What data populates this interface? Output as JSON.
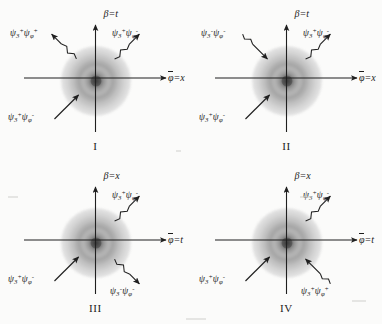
{
  "figure": {
    "type": "physics-feynman-diagram-grid",
    "rows": 2,
    "cols": 2,
    "background_color": "#fbfbfa",
    "ink_color": "#1f1f1f",
    "blob_center_color": "#3a3a3a",
    "blob_halo_color": "#d6d6d6"
  },
  "panels": [
    {
      "id": "I",
      "numeral": "I",
      "axis_vertical": {
        "greek": "β",
        "equals": "=",
        "var": "t"
      },
      "axis_horizontal": {
        "greek": "φ",
        "overbar": true,
        "equals": "=",
        "var": "x"
      },
      "particles": [
        {
          "slot": "top-left",
          "direction": "outgoing",
          "arrow_style": "wavy",
          "psi1": {
            "sym": "ψ",
            "sub": "3",
            "sup": "+"
          },
          "psi2": {
            "sym": "ψ",
            "sub": "φ",
            "sup": "+"
          }
        },
        {
          "slot": "top-right",
          "direction": "outgoing",
          "arrow_style": "wavy",
          "psi1": {
            "sym": "ψ",
            "sub": "3",
            "sup": "+"
          },
          "psi2": {
            "sym": "ψ",
            "sub": "φ",
            "sup": "-"
          }
        },
        {
          "slot": "bottom-left",
          "direction": "incoming",
          "arrow_style": "straight",
          "psi1": {
            "sym": "ψ",
            "sub": "3",
            "sup": "+"
          },
          "psi2": {
            "sym": "ψ",
            "sub": "φ",
            "sup": "-"
          }
        }
      ]
    },
    {
      "id": "II",
      "numeral": "II",
      "axis_vertical": {
        "greek": "β",
        "equals": "=",
        "var": "t"
      },
      "axis_horizontal": {
        "greek": "φ",
        "overbar": true,
        "equals": "=",
        "var": "x"
      },
      "particles": [
        {
          "slot": "top-left",
          "direction": "incoming",
          "arrow_style": "wavy",
          "psi1": {
            "sym": "ψ",
            "sub": "3",
            "sup": "-"
          },
          "psi2": {
            "sym": "ψ",
            "sub": "φ",
            "sup": "-"
          }
        },
        {
          "slot": "top-right",
          "direction": "outgoing",
          "arrow_style": "wavy",
          "psi1": {
            "sym": "ψ",
            "sub": "3",
            "sup": "+"
          },
          "psi2": {
            "sym": "ψ",
            "sub": "φ",
            "sup": "-"
          }
        },
        {
          "slot": "bottom-left",
          "direction": "incoming",
          "arrow_style": "straight",
          "psi1": {
            "sym": "ψ",
            "sub": "3",
            "sup": "+"
          },
          "psi2": {
            "sym": "ψ",
            "sub": "φ",
            "sup": "-"
          }
        }
      ]
    },
    {
      "id": "III",
      "numeral": "III",
      "axis_vertical": {
        "greek": "β",
        "equals": "=",
        "var": "x"
      },
      "axis_horizontal": {
        "greek": "φ",
        "overbar": true,
        "equals": "=",
        "var": "t"
      },
      "particles": [
        {
          "slot": "top-right",
          "direction": "outgoing",
          "arrow_style": "wavy",
          "psi1": {
            "sym": "ψ",
            "sub": "3",
            "sup": "+"
          },
          "psi2": {
            "sym": "ψ",
            "sub": "φ",
            "sup": "-"
          }
        },
        {
          "slot": "bottom-right",
          "direction": "outgoing",
          "arrow_style": "wavy",
          "psi1": {
            "sym": "ψ",
            "sub": "3",
            "sup": "-"
          },
          "psi2": {
            "sym": "ψ",
            "sub": "φ",
            "sup": "-"
          }
        },
        {
          "slot": "bottom-left",
          "direction": "incoming",
          "arrow_style": "straight",
          "psi1": {
            "sym": "ψ",
            "sub": "3",
            "sup": "+"
          },
          "psi2": {
            "sym": "ψ",
            "sub": "φ",
            "sup": "-"
          }
        }
      ]
    },
    {
      "id": "IV",
      "numeral": "IV",
      "axis_vertical": {
        "greek": "β",
        "equals": "=",
        "var": "x"
      },
      "axis_horizontal": {
        "greek": "φ",
        "overbar": true,
        "equals": "=",
        "var": "t"
      },
      "particles": [
        {
          "slot": "top-right",
          "direction": "outgoing",
          "arrow_style": "wavy",
          "psi1": {
            "sym": "ψ",
            "sub": "3",
            "sup": "+"
          },
          "psi2": {
            "sym": "ψ",
            "sub": "φ",
            "sup": "-"
          }
        },
        {
          "slot": "bottom-right",
          "direction": "incoming",
          "arrow_style": "wavy",
          "psi1": {
            "sym": "ψ",
            "sub": "3",
            "sup": "+"
          },
          "psi2": {
            "sym": "ψ",
            "sub": "φ",
            "sup": "+"
          }
        },
        {
          "slot": "bottom-left",
          "direction": "incoming",
          "arrow_style": "straight",
          "psi1": {
            "sym": "ψ",
            "sub": "3",
            "sup": "+"
          },
          "psi2": {
            "sym": "ψ",
            "sub": "φ",
            "sup": "-"
          }
        }
      ]
    }
  ]
}
